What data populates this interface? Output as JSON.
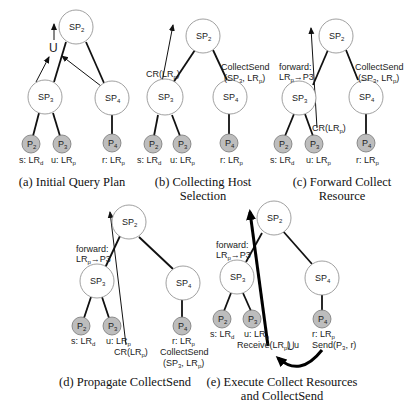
{
  "panels": {
    "a": {
      "caption": [
        "(a) Initial Query Plan"
      ],
      "nodes": {
        "sp2": "SP",
        "sp3": "SP",
        "sp4": "SP",
        "p2": "P",
        "p3": "P",
        "p4": "P"
      },
      "subs": {
        "sp2": "2",
        "sp3": "3",
        "sp4": "4",
        "p2": "2",
        "p3": "3",
        "p4": "4"
      },
      "union": "U",
      "leaf_labels": {
        "p2": "s: LR",
        "p2_sub": "d",
        "p3": "u: LR",
        "p3_sub": "p",
        "p4": "r: LR",
        "p4_sub": "p"
      }
    },
    "b": {
      "caption": [
        "(b) Collecting Host",
        "Selection"
      ],
      "cr_label": "CR(LR",
      "cr_sub": "p",
      "cr_close": ")",
      "collect_send_1": "CollectSend",
      "collect_send_2": "(SP",
      "collect_send_2_sub": "3",
      "collect_send_2_rest": ", LR",
      "collect_send_2_sub2": "p",
      "collect_send_2_close": ")"
    },
    "c": {
      "caption": [
        "(c) Forward Collect",
        "Resource"
      ],
      "forward_1": "forward:",
      "forward_2": "LR",
      "forward_2_sub": "p",
      "forward_2_rest": "→P3",
      "cr_label": "CR(LR",
      "cr_sub": "p",
      "cr_close": ")",
      "collect_send_1": "CollectSend",
      "collect_send_2": "(SP",
      "collect_send_2_sub": "3",
      "collect_send_2_rest": ", LR",
      "collect_send_2_sub2": "p",
      "collect_send_2_close": ")"
    },
    "d": {
      "caption": [
        "(d) Propagate CollectSend"
      ],
      "forward_1": "forward:",
      "forward_2": "LR",
      "forward_2_sub": "p",
      "forward_2_rest": "→P3",
      "cr_label": "CR(LR",
      "cr_sub": "p",
      "cr_close": ")",
      "p4_extra_1": "CollectSend",
      "p4_extra_2": "(SP",
      "p4_extra_2_sub": "3",
      "p4_extra_2_rest": ", LR",
      "p4_extra_2_sub2": "p",
      "p4_extra_2_close": ")"
    },
    "e": {
      "caption": [
        "(e) Execute Collect Resources",
        "and CollectSend"
      ],
      "forward_1": "forward:",
      "forward_2": "LR",
      "forward_2_sub": "p",
      "forward_2_rest": "→P3",
      "receive": "Receive(LR",
      "receive_sub": "p",
      "receive_close": ")",
      "union_u": "⋃u",
      "send": "Send(P",
      "send_sub": "3",
      "send_rest": ", r)"
    }
  },
  "colors": {
    "internal_node_fill": "#ffffff",
    "leaf_node_fill": "#bdbdbd",
    "edge": "#111111"
  }
}
